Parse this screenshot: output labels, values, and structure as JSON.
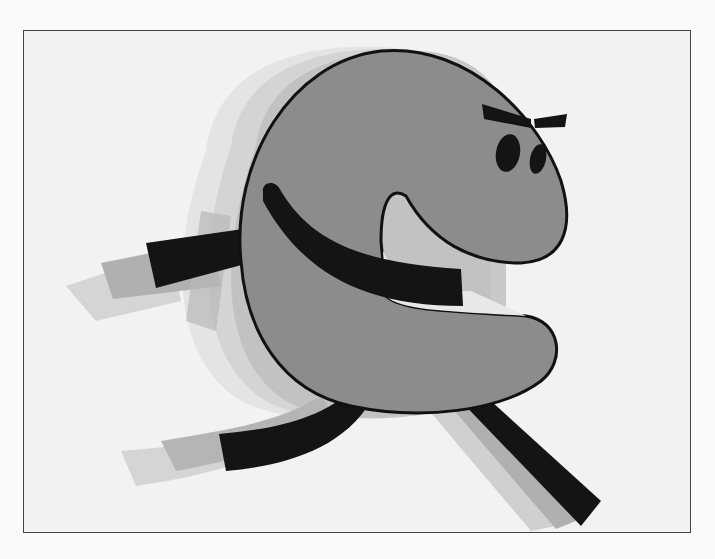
{
  "illustration": {
    "subject": "running cartoon letter C character with motion blur",
    "colors": {
      "background": "#f2f2f2",
      "body": "#8c8c8c",
      "outline": "#111111",
      "limbs": "#141414",
      "ghost_light": "#d8d8d8",
      "ghost_mid": "#b5b5b5",
      "ghost_dark": "#9a9a9a"
    }
  }
}
